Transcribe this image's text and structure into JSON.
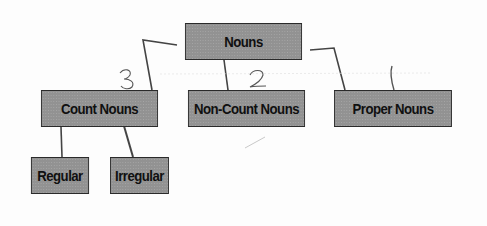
{
  "diagram": {
    "type": "tree",
    "root": {
      "label": "Nouns",
      "children": [
        {
          "label": "Count Nouns",
          "annotation": "3",
          "children": [
            {
              "label": "Regular"
            },
            {
              "label": "Irregular"
            }
          ]
        },
        {
          "label": "Non-Count Nouns",
          "annotation": "2"
        },
        {
          "label": "Proper Nouns",
          "annotation": "1"
        }
      ]
    },
    "colors": {
      "box_fill": "#9a9a9a",
      "box_border": "#2a2a2a",
      "text": "#101010",
      "connector": "#444444",
      "handwriting": "#555555"
    }
  }
}
